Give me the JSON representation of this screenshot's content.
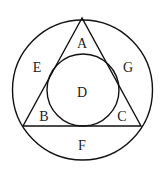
{
  "diagram": {
    "type": "geometry",
    "stroke_color": "#111111",
    "regions": {
      "A": "A",
      "B": "B",
      "C": "C",
      "D": "D",
      "E": "E",
      "F": "F",
      "G": "G"
    }
  }
}
